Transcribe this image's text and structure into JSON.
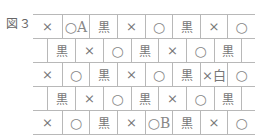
{
  "figure": {
    "label": "図３"
  },
  "symbols": {
    "batsu": "×",
    "maru": "○",
    "kuro": "黒"
  },
  "grid": {
    "rows": [
      {
        "offset": false,
        "cells": [
          "×",
          "○A",
          "黒",
          "×",
          "○",
          "黒",
          "×",
          "○"
        ]
      },
      {
        "offset": true,
        "cells": [
          "黒",
          "×",
          "○",
          "黒",
          "×",
          "○",
          "黒"
        ]
      },
      {
        "offset": false,
        "cells": [
          "×",
          "○",
          "黒",
          "×",
          "○",
          "黒",
          "×白",
          "○"
        ]
      },
      {
        "offset": true,
        "cells": [
          "黒",
          "×",
          "○",
          "黒",
          "×",
          "○",
          "黒"
        ]
      },
      {
        "offset": false,
        "cells": [
          "×",
          "○",
          "黒",
          "×",
          "○B",
          "黒",
          "×",
          "○"
        ]
      }
    ]
  },
  "labels": {
    "A": "A",
    "B": "B",
    "white": "白"
  }
}
